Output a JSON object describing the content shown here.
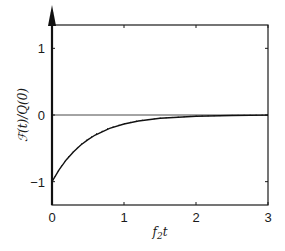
{
  "chart_data": {
    "type": "line",
    "title": "",
    "xlabel": "f2t",
    "xlabel_display": {
      "base": "f",
      "sub": "2",
      "tail": "t"
    },
    "ylabel": "F(t)/Q(0)",
    "xlim": [
      0,
      3
    ],
    "ylim": [
      -1.35,
      1.35
    ],
    "xticks": [
      "0",
      "1",
      "2",
      "3"
    ],
    "yticks": [
      "-1",
      "0",
      "1"
    ],
    "yticks_display": [
      "−1",
      "0",
      "1"
    ],
    "grid": false,
    "legend": null,
    "annotations": [
      "vertical arrow at t=0 (delta spike) extending above the plot",
      "horizontal reference line at y=0"
    ],
    "series": [
      {
        "name": "exact",
        "style": "solid",
        "x": [
          0,
          0.1,
          0.2,
          0.3,
          0.4,
          0.5,
          0.6,
          0.8,
          1.0,
          1.2,
          1.5,
          2.0,
          2.5,
          3.0
        ],
        "y": [
          -1.0,
          -0.82,
          -0.67,
          -0.55,
          -0.45,
          -0.37,
          -0.3,
          -0.2,
          -0.135,
          -0.09,
          -0.05,
          -0.018,
          -0.007,
          -0.002
        ]
      },
      {
        "name": "approx",
        "style": "dotted",
        "x": [
          0,
          0.1,
          0.2,
          0.3,
          0.4,
          0.5,
          0.6,
          0.8,
          1.0,
          1.2,
          1.5,
          2.0,
          2.5,
          3.0
        ],
        "y": [
          -1.0,
          -0.81,
          -0.66,
          -0.54,
          -0.44,
          -0.36,
          -0.29,
          -0.19,
          -0.13,
          -0.085,
          -0.047,
          -0.016,
          -0.006,
          -0.002
        ]
      }
    ],
    "spike": {
      "x": 0,
      "direction": "up"
    }
  }
}
